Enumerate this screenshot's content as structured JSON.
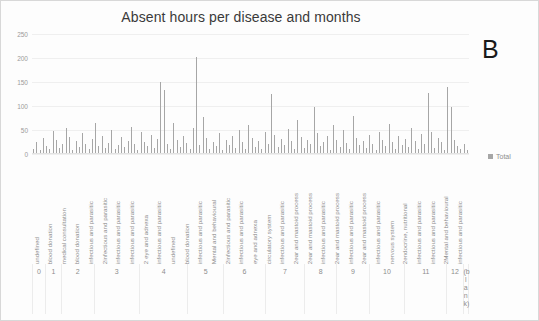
{
  "chart_data": {
    "type": "bar",
    "title": "Absent hours per disease and months",
    "xlabel": "",
    "ylabel": "",
    "ylim": [
      0,
      250
    ],
    "yticks": [
      0,
      50,
      100,
      150,
      200,
      250
    ],
    "grid": true,
    "legend": {
      "position": "right",
      "entries": [
        "Total"
      ]
    },
    "annotation": "B",
    "series": [
      {
        "name": "Total",
        "color": "#a6a6a6",
        "values": [
          8,
          22,
          6,
          31,
          14,
          9,
          46,
          27,
          11,
          19,
          52,
          34,
          7,
          24,
          13,
          41,
          18,
          9,
          29,
          62,
          15,
          36,
          11,
          21,
          48,
          8,
          17,
          33,
          12,
          26,
          55,
          19,
          7,
          44,
          23,
          14,
          38,
          10,
          29,
          147,
          132,
          18,
          9,
          63,
          27,
          12,
          35,
          21,
          8,
          53,
          199,
          16,
          74,
          31,
          9,
          22,
          14,
          41,
          6,
          28,
          17,
          36,
          11,
          47,
          23,
          9,
          58,
          32,
          13,
          26,
          8,
          44,
          19,
          122,
          37,
          12,
          29,
          16,
          51,
          24,
          9,
          68,
          33,
          11,
          27,
          18,
          96,
          41,
          14,
          22,
          35,
          7,
          59,
          28,
          13,
          48,
          21,
          9,
          77,
          32,
          16,
          24,
          11,
          38,
          19,
          6,
          43,
          27,
          14,
          61,
          23,
          9,
          36,
          17,
          29,
          12,
          52,
          25,
          8,
          39,
          18,
          124,
          44,
          11,
          31,
          22,
          7,
          137,
          96,
          27,
          14,
          9,
          19,
          6
        ]
      }
    ],
    "categories_note": "Disease category labels repeat per month group; rotated 90 degrees",
    "category_labels": [
      "undefined",
      "blood donation",
      "medical consultation",
      "blood donation",
      "infectious and parasitic",
      "2infectious and parasitic",
      "infectious and parasitic",
      "infectious and parasitic",
      "2 eye and adnexa",
      "infectious and parasitic",
      "undefined",
      "blood donation",
      "infectious and parasitic",
      "Mental and behavioural",
      "2infectious and parasitic",
      "infectious and parasitic",
      "eye and adnexa",
      "circulatory system",
      "infectious and parasitic",
      "2ear and mastoid process",
      "2ear and mastoid process",
      "infectious and parasitic",
      "2ear and mastoid process",
      "infectious and parasitic",
      "2ear and mastoid process",
      "infectious and parasitic",
      "nervous system",
      "2endocrine, nutritional",
      "infectious and parasitic",
      "infectious and parasitic",
      "2Mental and behavioural",
      "infectious and parasitic"
    ],
    "month_groups": [
      {
        "label": "0",
        "bars": 4
      },
      {
        "label": "1",
        "bars": 5
      },
      {
        "label": "2",
        "bars": 10
      },
      {
        "label": "3",
        "bars": 14
      },
      {
        "label": "4",
        "bars": 15
      },
      {
        "label": "5",
        "bars": 11
      },
      {
        "label": "6",
        "bars": 13
      },
      {
        "label": "7",
        "bars": 12
      },
      {
        "label": "8",
        "bars": 10
      },
      {
        "label": "9",
        "bars": 10
      },
      {
        "label": "10",
        "bars": 11
      },
      {
        "label": "11",
        "bars": 13
      },
      {
        "label": "12",
        "bars": 5
      },
      {
        "label": "(bl an k)",
        "bars": 2
      }
    ]
  }
}
